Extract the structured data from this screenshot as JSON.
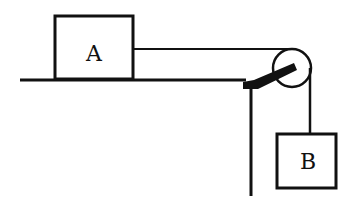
{
  "diagram": {
    "type": "atwood-table-pulley",
    "colors": {
      "stroke": "#111111",
      "background": "#ffffff"
    },
    "blocks": [
      {
        "id": "A",
        "label": "A",
        "x": 55,
        "y": 16,
        "w": 78,
        "h": 63
      },
      {
        "id": "B",
        "label": "B",
        "x": 276,
        "y": 134,
        "w": 60,
        "h": 54
      }
    ],
    "table": {
      "surface_y": 80,
      "x_start": 20,
      "x_end": 245,
      "leg_x": 251,
      "leg_bottom": 196
    },
    "pulley": {
      "cx": 292,
      "cy": 68,
      "r": 19
    },
    "strings": [
      {
        "name": "horizontal",
        "from": [
          133,
          49
        ],
        "to": [
          292,
          49
        ]
      },
      {
        "name": "vertical",
        "from": [
          311,
          68
        ],
        "to": [
          311,
          134
        ]
      }
    ]
  }
}
